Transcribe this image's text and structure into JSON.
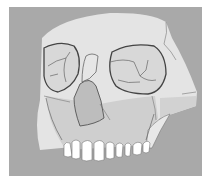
{
  "image": {
    "subject": "skull illustration",
    "description": "Frontal view of a partially reconstructed human skull with orbits, nasal aperture and upper teeth",
    "colors": {
      "background": "#a9a9a9",
      "bone_light": "#e6e6e6",
      "bone_mid": "#cfcfcf",
      "bone_dark": "#bdbdbd",
      "orbit": "#d6d6d6",
      "outline": "#555555",
      "teeth": "#ffffff"
    },
    "teeth_count": 10
  }
}
